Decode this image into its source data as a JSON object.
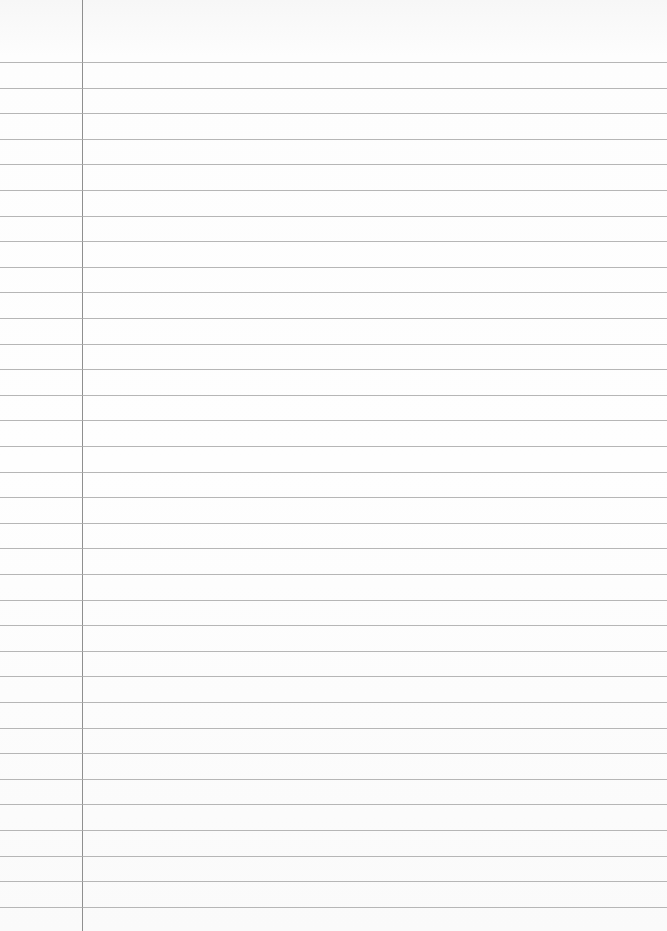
{
  "page": {
    "type": "ruled notebook paper",
    "content": "",
    "colors": {
      "paper": "#fdfdfd",
      "rule_line": "#a9a9a9",
      "margin_line": "#8f8f8f"
    },
    "margin_x": 82,
    "first_line_y": 62,
    "line_spacing": 25.6,
    "line_count": 34
  }
}
